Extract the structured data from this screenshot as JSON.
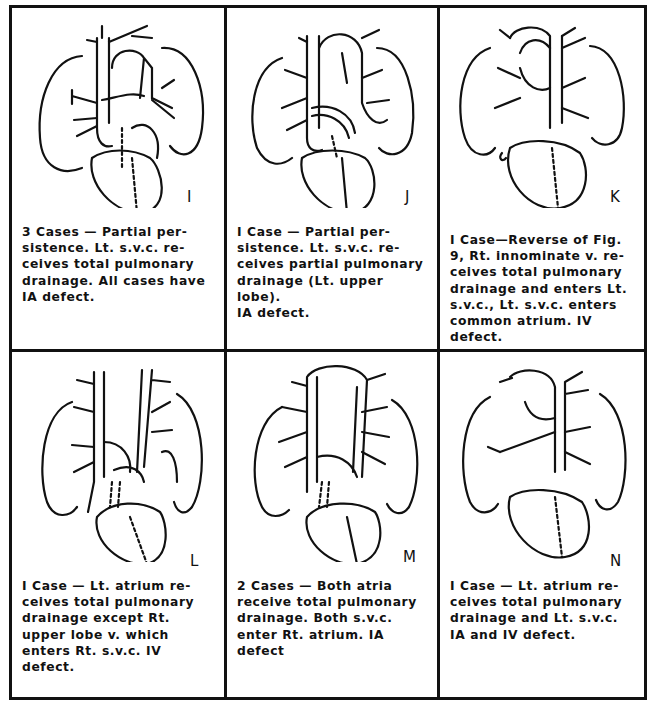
{
  "figure": {
    "panels": [
      {
        "id": "I",
        "letter": "I",
        "caption": "3 Cases — Partial per-\nsistence. Lt. s.v.c. re-\nceives total pulmonary\ndrainage. All cases have\nIA defect."
      },
      {
        "id": "J",
        "letter": "J",
        "caption": "I Case — Partial per-\nsistence. Lt. s.v.c. re-\nceives partial pulmonary\ndrainage (Lt. upper lobe).\nIA defect."
      },
      {
        "id": "K",
        "letter": "K",
        "caption": "I Case—Reverse of Fig.\n9, Rt. innominate v. re-\nceives total pulmonary\ndrainage and enters Lt.\ns.v.c., Lt. s.v.c. enters\ncommon atrium. IV\ndefect."
      },
      {
        "id": "L",
        "letter": "L",
        "caption": "I Case — Lt. atrium re-\nceives total pulmonary\ndrainage except Rt.\nupper lobe v. which\nenters Rt. s.v.c. IV\ndefect."
      },
      {
        "id": "M",
        "letter": "M",
        "caption": "2 Cases — Both atria\nreceive total pulmonary\ndrainage. Both s.v.c.\nenter Rt. atrium. IA\ndefect"
      },
      {
        "id": "N",
        "letter": "N",
        "caption": "I Case — Lt. atrium re-\nceives total pulmonary\ndrainage and Lt. s.v.c.\nIA and IV defect."
      }
    ]
  }
}
